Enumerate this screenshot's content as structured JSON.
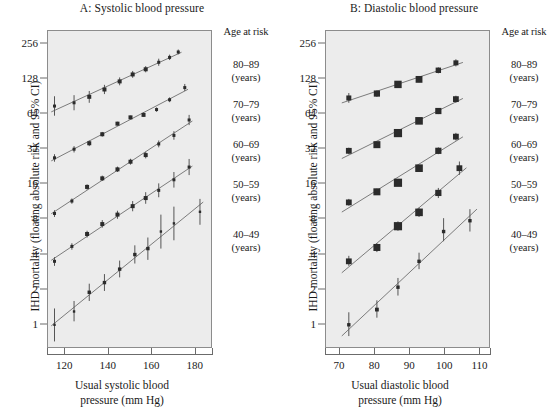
{
  "figure": {
    "background": "#ffffff",
    "plot_background": "#ececec",
    "ink": "#1a1a1a"
  },
  "panels": [
    {
      "id": "A",
      "title": "A: Systolic blood pressure",
      "xlabel_line1": "Usual systolic blood",
      "xlabel_line2": "pressure (mm Hg)",
      "ylabel": "IHD mortality (floating absolute risk and 95% CI)"
    },
    {
      "id": "B",
      "title": "B: Diastolic blood pressure",
      "xlabel_line1": "Usual diastolic blood",
      "xlabel_line2": "pressure (mm Hg)",
      "ylabel": "IHD mortality (floating absolute risk and 95% CI)"
    }
  ],
  "legend": {
    "title": "Age at risk",
    "unit": "(years)",
    "items": [
      {
        "range": "80–89",
        "unit": "(years)"
      },
      {
        "range": "70–79",
        "unit": "(years)"
      },
      {
        "range": "60–69",
        "unit": "(years)"
      },
      {
        "range": "50–59",
        "unit": "(years)"
      },
      {
        "range": "40–49",
        "unit": "(years)"
      }
    ]
  },
  "chart_data": [
    {
      "type": "scatter",
      "panel": "A",
      "title": "A: Systolic blood pressure",
      "xlabel": "Usual systolic blood pressure (mm Hg)",
      "ylabel": "IHD mortality (floating absolute risk and 95% CI)",
      "yscale": "log2",
      "yticks": [
        1,
        2,
        4,
        8,
        16,
        32,
        64,
        128,
        256
      ],
      "ytick_labels": [
        "1",
        "2",
        "4",
        "8",
        "16",
        "32",
        "64",
        "128",
        "256"
      ],
      "ylim": [
        0.62,
        330
      ],
      "xticks": [
        120,
        140,
        160,
        180
      ],
      "xtick_labels": [
        "120",
        "140",
        "160",
        "180"
      ],
      "xlim": [
        112,
        188
      ],
      "grid": false,
      "legend_position": "right",
      "series": [
        {
          "name": "80–89 (years)",
          "x": [
            115,
            124,
            131,
            138,
            145,
            151,
            157,
            163,
            168,
            172
          ],
          "y": [
            75,
            80,
            90,
            104,
            122,
            140,
            155,
            178,
            196,
            218
          ],
          "ci_low": [
            62,
            69,
            80,
            95,
            113,
            131,
            146,
            166,
            186,
            208
          ],
          "ci_high": [
            91,
            93,
            101,
            114,
            132,
            150,
            165,
            191,
            207,
            229
          ]
        },
        {
          "name": "70–79 (years)",
          "x": [
            115,
            124,
            131,
            137,
            144,
            150,
            156,
            162,
            168,
            175
          ],
          "y": [
            27,
            32,
            36,
            43,
            53,
            60,
            63,
            70,
            85,
            108
          ],
          "ci_low": [
            25,
            30,
            34,
            41,
            51,
            58,
            61,
            67,
            81,
            101
          ],
          "ci_high": [
            29,
            34,
            38,
            45,
            55,
            62,
            66,
            73,
            89,
            116
          ]
        },
        {
          "name": "60–69 (years)",
          "x": [
            115,
            123,
            130,
            137,
            144,
            150,
            157,
            163,
            170,
            177
          ],
          "y": [
            9.0,
            11.5,
            15.2,
            18.0,
            21.5,
            25.0,
            28.5,
            35.5,
            42.0,
            57.0
          ],
          "ci_low": [
            8.4,
            10.9,
            14.4,
            17.1,
            20.4,
            23.6,
            26.7,
            33.2,
            38.6,
            51.5
          ],
          "ci_high": [
            9.6,
            12.1,
            16.0,
            19.0,
            22.7,
            26.5,
            30.4,
            38.0,
            45.7,
            63.0
          ]
        },
        {
          "name": "50–59 (years)",
          "x": [
            115,
            123,
            130,
            137,
            144,
            151,
            157,
            163,
            170,
            177
          ],
          "y": [
            3.5,
            4.7,
            6.0,
            7.3,
            8.8,
            10.4,
            12.2,
            14.2,
            17.5,
            22.5
          ],
          "ci_low": [
            3.2,
            4.4,
            5.6,
            6.8,
            8.1,
            9.4,
            10.9,
            12.4,
            15.0,
            19.2
          ],
          "ci_high": [
            3.8,
            5.0,
            6.4,
            7.9,
            9.5,
            11.5,
            13.7,
            16.3,
            20.4,
            26.4
          ]
        },
        {
          "name": "40–49 (years)",
          "x": [
            115,
            124,
            131,
            138,
            145,
            152,
            158,
            164,
            170,
            182
          ],
          "y": [
            1.0,
            1.3,
            1.9,
            2.3,
            3.0,
            4.0,
            4.5,
            6.3,
            7.4,
            9.3
          ],
          "ci_low": [
            0.72,
            1.07,
            1.6,
            1.95,
            2.55,
            3.35,
            3.6,
            4.5,
            5.3,
            7.2
          ],
          "ci_high": [
            1.38,
            1.6,
            2.25,
            2.72,
            3.55,
            4.8,
            5.6,
            8.8,
            10.3,
            12.0
          ]
        }
      ]
    },
    {
      "type": "scatter",
      "panel": "B",
      "title": "B: Diastolic blood pressure",
      "xlabel": "Usual diastolic blood pressure (mm Hg)",
      "ylabel": "IHD mortality (floating absolute risk and 95% CI)",
      "yscale": "log2",
      "yticks": [
        1,
        2,
        4,
        8,
        16,
        32,
        64,
        128,
        256
      ],
      "ytick_labels": [
        "1",
        "2",
        "4",
        "8",
        "16",
        "32",
        "64",
        "128",
        "256"
      ],
      "ylim": [
        0.62,
        330
      ],
      "xticks": [
        70,
        80,
        90,
        100,
        110
      ],
      "xtick_labels": [
        "70",
        "80",
        "90",
        "100",
        "110"
      ],
      "xlim": [
        66,
        113
      ],
      "grid": false,
      "legend_position": "right",
      "series": [
        {
          "name": "80–89 (years)",
          "x": [
            72.5,
            80.5,
            86.5,
            92.5,
            98,
            103
          ],
          "y": [
            88,
            96,
            115,
            127,
            152,
            176
          ],
          "ci_low": [
            80,
            90,
            109,
            120,
            143,
            164
          ],
          "ci_high": [
            97,
            102,
            121,
            134,
            161,
            189
          ]
        },
        {
          "name": "70–79 (years)",
          "x": [
            72.5,
            80.5,
            86.5,
            92.5,
            98,
            103
          ],
          "y": [
            31,
            35,
            44,
            56,
            68,
            86
          ],
          "ci_low": [
            29,
            33,
            42,
            53,
            64,
            80
          ],
          "ci_high": [
            33,
            37,
            46,
            59,
            72,
            92
          ]
        },
        {
          "name": "60–69 (years)",
          "x": [
            72.5,
            80.5,
            86.5,
            92.5,
            98,
            103
          ],
          "y": [
            11.2,
            13.8,
            16.5,
            22.0,
            31.0,
            41.0
          ],
          "ci_low": [
            10.5,
            13.0,
            15.6,
            20.7,
            29.0,
            38.0
          ],
          "ci_high": [
            12.0,
            14.7,
            17.5,
            23.4,
            33.2,
            44.2
          ]
        },
        {
          "name": "50–59 (years)",
          "x": [
            72.5,
            80.5,
            86.5,
            92.5,
            98,
            104
          ],
          "y": [
            3.5,
            4.6,
            7.0,
            9.2,
            13.5,
            22.0
          ],
          "ci_low": [
            3.2,
            4.2,
            6.4,
            8.4,
            12.2,
            19.3
          ],
          "ci_high": [
            3.9,
            5.0,
            7.7,
            10.1,
            14.9,
            25.1
          ]
        },
        {
          "name": "40–49 (years)",
          "x": [
            72.5,
            80.5,
            86.5,
            92.5,
            99.5,
            107
          ],
          "y": [
            1.0,
            1.35,
            2.1,
            3.5,
            6.3,
            7.8
          ],
          "ci_low": [
            0.8,
            1.15,
            1.78,
            3.0,
            5.2,
            6.3
          ],
          "ci_high": [
            1.28,
            1.62,
            2.52,
            4.15,
            8.2,
            9.8
          ]
        }
      ]
    }
  ]
}
